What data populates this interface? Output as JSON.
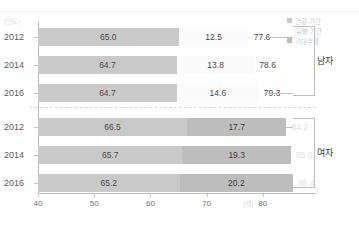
{
  "banner": {
    "text": ""
  },
  "axes": {
    "y_unit": "(연도)",
    "x_unit": "(세)",
    "x_ticks": [
      "40",
      "50",
      "60",
      "70",
      "80"
    ]
  },
  "legend": {
    "items": [
      {
        "label": "건강 기간",
        "swatch": "healthy",
        "color": "#c9c9c9"
      },
      {
        "label": "유병 기간",
        "swatch": "none",
        "color": "#fbfbfb"
      },
      {
        "label": "기대수명",
        "swatch": "life",
        "color": "#bdbdbd"
      }
    ]
  },
  "groups": [
    {
      "name": "남자",
      "label": "남자"
    },
    {
      "name": "여자",
      "label": "여자"
    }
  ],
  "rows": [
    {
      "year": "2012",
      "group": "남자",
      "healthy": "65.0",
      "ill": "12.5",
      "life": "77.6"
    },
    {
      "year": "2014",
      "group": "남자",
      "healthy": "64.7",
      "ill": "13.8",
      "life": "78.6"
    },
    {
      "year": "2016",
      "group": "남자",
      "healthy": "64.7",
      "ill": "14.6",
      "life": "79.3"
    },
    {
      "year": "2012",
      "group": "여자",
      "healthy": "66.5",
      "ill": "17.7",
      "life": "84.2"
    },
    {
      "year": "2014",
      "group": "여자",
      "healthy": "65.7",
      "ill": "19.3",
      "life": "85.0"
    },
    {
      "year": "2016",
      "group": "여자",
      "healthy": "65.2",
      "ill": "20.2",
      "life": "85.4"
    }
  ],
  "chart_data": {
    "type": "bar",
    "title": "",
    "xlabel": "(세)",
    "ylabel": "(연도)",
    "xlim": [
      40,
      88
    ],
    "grid": false,
    "legend_position": "top-right",
    "orientation": "horizontal",
    "stacked": true,
    "categories": [
      "남자 2012",
      "남자 2014",
      "남자 2016",
      "여자 2012",
      "여자 2014",
      "여자 2016"
    ],
    "series": [
      {
        "name": "건강 기간",
        "values": [
          65.0,
          64.7,
          64.7,
          66.5,
          65.7,
          65.2
        ]
      },
      {
        "name": "유병 기간",
        "values": [
          12.5,
          13.8,
          14.6,
          17.7,
          19.3,
          20.2
        ]
      },
      {
        "name": "기대수명",
        "values": [
          77.6,
          78.6,
          79.3,
          84.2,
          85.0,
          85.4
        ]
      }
    ],
    "xticks": [
      40,
      50,
      60,
      70,
      80
    ]
  }
}
